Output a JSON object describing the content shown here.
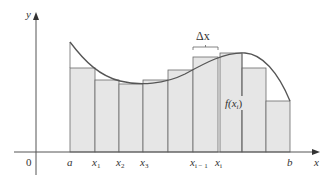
{
  "figure": {
    "type": "riemann-sum-diagram",
    "axes": {
      "x_label": "x",
      "y_label": "y",
      "origin_label": "0"
    },
    "tick_labels": [
      {
        "text": "a",
        "sub": "",
        "x": 70
      },
      {
        "text": "x",
        "sub": "1",
        "x": 95
      },
      {
        "text": "x",
        "sub": "2",
        "x": 119
      },
      {
        "text": "x",
        "sub": "3",
        "x": 143
      },
      {
        "text": "x",
        "sub": "i − 1",
        "x": 193
      },
      {
        "text": "x",
        "sub": "i",
        "x": 218
      },
      {
        "text": "b",
        "sub": "",
        "x": 290
      }
    ],
    "delta_label": "Δx",
    "height_label": "f(x",
    "height_label_sub": "i",
    "height_label_close": ")",
    "rectangles": [
      {
        "x0": 70,
        "x1": 95,
        "top": 68
      },
      {
        "x0": 95,
        "x1": 119,
        "top": 80
      },
      {
        "x0": 119,
        "x1": 143,
        "top": 84
      },
      {
        "x0": 143,
        "x1": 168,
        "top": 80
      },
      {
        "x0": 168,
        "x1": 193,
        "top": 70
      },
      {
        "x0": 193,
        "x1": 218,
        "top": 57
      },
      {
        "x0": 220,
        "x1": 242,
        "top": 53
      },
      {
        "x0": 242,
        "x1": 266,
        "top": 68
      },
      {
        "x0": 266,
        "x1": 290,
        "top": 101
      }
    ],
    "colors": {
      "rect_fill": "#e6e6e6",
      "rect_stroke": "#6a6a6a",
      "curve": "#555555",
      "axis": "#555555",
      "text": "#333333"
    }
  }
}
